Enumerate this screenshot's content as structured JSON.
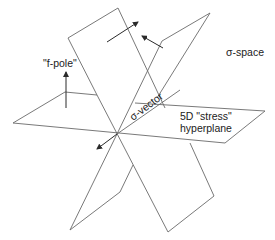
{
  "diagram": {
    "labels": {
      "f_pole": "\"f-pole\"",
      "sigma_space": "σ-space",
      "sigma_vector": "σ-vector",
      "hyperplane_line1": "5D \"stress\"",
      "hyperplane_line2": "hyperplane"
    },
    "colors": {
      "edge": "#6a6a6a",
      "arrow": "#2a2a2a",
      "text": "#222222",
      "background": "#ffffff"
    }
  }
}
